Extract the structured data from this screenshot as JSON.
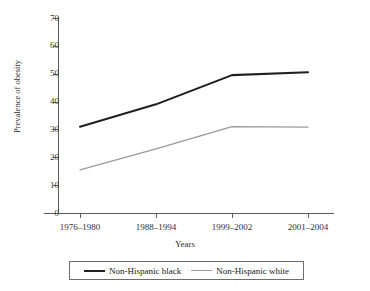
{
  "figure": {
    "top_caption_sliver": "",
    "background_color": "#ffffff"
  },
  "chart_data": {
    "type": "line",
    "title": "",
    "xlabel": "Years",
    "ylabel": "Prevalence of obesity",
    "categories": [
      "1976–1980",
      "1988–1994",
      "1999–2002",
      "2001–2004"
    ],
    "ylim": [
      0,
      70
    ],
    "yticks": [
      0,
      10,
      20,
      30,
      40,
      50,
      60,
      70
    ],
    "ytick_labels": [
      "0",
      "10",
      "20",
      "30",
      "40",
      "50",
      "60",
      "70"
    ],
    "grid": false,
    "legend_position": "bottom",
    "series": [
      {
        "name": "Non-Hispanic black",
        "color": "#231f20",
        "line_width": 2.1,
        "values": [
          31,
          39,
          49.5,
          50.5
        ]
      },
      {
        "name": "Non-Hispanic white",
        "color": "#9a9a9a",
        "line_width": 1.2,
        "values": [
          15.5,
          23,
          31,
          30.8
        ]
      }
    ]
  },
  "legend": {
    "entries": [
      {
        "label": "Non-Hispanic black",
        "swatch": "thick-black-line"
      },
      {
        "label": "Non-Hispanic white",
        "swatch": "thin-gray-line"
      }
    ]
  },
  "axis_colors": {
    "axis_line": "#5a5a5a",
    "tick_label": "#3a3a3a",
    "legend_border": "#6d6d6d"
  }
}
